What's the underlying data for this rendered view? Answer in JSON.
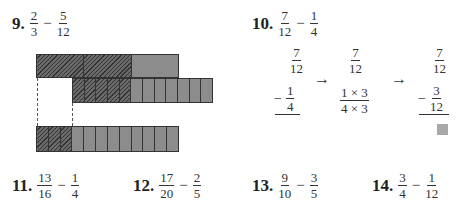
{
  "problems": {
    "p9": {
      "number": "9.",
      "a": {
        "n": "2",
        "d": "3"
      },
      "op": "−",
      "b": {
        "n": "5",
        "d": "12"
      }
    },
    "p10": {
      "number": "10.",
      "a": {
        "n": "7",
        "d": "12"
      },
      "op": "−",
      "b": {
        "n": "1",
        "d": "4"
      }
    },
    "p11": {
      "number": "11.",
      "a": {
        "n": "13",
        "d": "16"
      },
      "op": "−",
      "b": {
        "n": "1",
        "d": "4"
      }
    },
    "p12": {
      "number": "12.",
      "a": {
        "n": "17",
        "d": "20"
      },
      "op": "−",
      "b": {
        "n": "2",
        "d": "5"
      }
    },
    "p13": {
      "number": "13.",
      "a": {
        "n": "9",
        "d": "10"
      },
      "op": "−",
      "b": {
        "n": "3",
        "d": "5"
      }
    },
    "p14": {
      "number": "14.",
      "a": {
        "n": "3",
        "d": "4"
      },
      "op": "−",
      "b": {
        "n": "1",
        "d": "12"
      }
    }
  },
  "diagram9": {
    "top_bar": {
      "sections": 3,
      "hatched": 2
    },
    "middle_bar": {
      "sections": 12,
      "hatched": 5
    },
    "bottom_bar": {
      "sections": 12,
      "hatched": 3
    }
  },
  "work10": {
    "step1": {
      "top": {
        "n": "7",
        "d": "12"
      },
      "minus": "−",
      "bottom": {
        "n": "1",
        "d": "4"
      }
    },
    "arrow": "→",
    "step2": {
      "top": {
        "n": "7",
        "d": "12"
      },
      "bottom": {
        "n": "1 × 3",
        "d": "4 × 3"
      }
    },
    "step3": {
      "top": {
        "n": "7",
        "d": "12"
      },
      "minus": "−",
      "bottom": {
        "n": "3",
        "d": "12"
      }
    },
    "answer_box_color": "#a9a9a9"
  },
  "colors": {
    "hatch_dark": "#333333",
    "fill_gray": "#8c8c8c"
  }
}
